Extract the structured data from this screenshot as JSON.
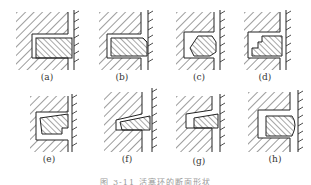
{
  "figure": {
    "panels": [
      {
        "id": "a",
        "label": "(a)",
        "shape": "rectangular"
      },
      {
        "id": "b",
        "label": "(b)",
        "shape": "taper-face"
      },
      {
        "id": "c",
        "label": "(c)",
        "shape": "inner-bevel"
      },
      {
        "id": "d",
        "label": "(d)",
        "shape": "inner-step"
      },
      {
        "id": "e",
        "label": "(e)",
        "shape": "keystone-step"
      },
      {
        "id": "f",
        "label": "(f)",
        "shape": "wedge-taper"
      },
      {
        "id": "g",
        "label": "(g)",
        "shape": "narrow-taper"
      },
      {
        "id": "h",
        "label": "(h)",
        "shape": "barrel-face"
      }
    ],
    "caption": "图 3-11  活塞环的断面形状"
  },
  "colors": {
    "line": "#222222",
    "background": "#ffffff"
  }
}
